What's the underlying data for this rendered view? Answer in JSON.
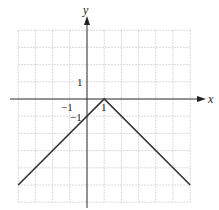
{
  "chart_data": {
    "type": "line",
    "title": "",
    "xlabel": "x",
    "ylabel": "y",
    "function": "y = -|x - 1|",
    "xlim": [
      -4,
      6
    ],
    "ylim": [
      -6,
      4
    ],
    "grid": true,
    "grid_step": 1,
    "tick_labels": {
      "x": [
        {
          "value": -1,
          "label": "−1"
        },
        {
          "value": 1,
          "label": "1"
        }
      ],
      "y": [
        {
          "value": 1,
          "label": "1"
        },
        {
          "value": -1,
          "label": "−1"
        }
      ]
    },
    "series": [
      {
        "name": "y = -|x - 1|",
        "color": "#333333",
        "points": [
          [
            -4,
            -5
          ],
          [
            1,
            0
          ],
          [
            6,
            -5
          ]
        ]
      }
    ]
  },
  "labels": {
    "x_axis": "x",
    "y_axis": "y",
    "x_tick_neg1": "−1",
    "x_tick_1": "1",
    "y_tick_1": "1",
    "y_tick_neg1": "−1"
  },
  "colors": {
    "grid": "#c8c8c8",
    "axis": "#333333",
    "line": "#333333"
  }
}
